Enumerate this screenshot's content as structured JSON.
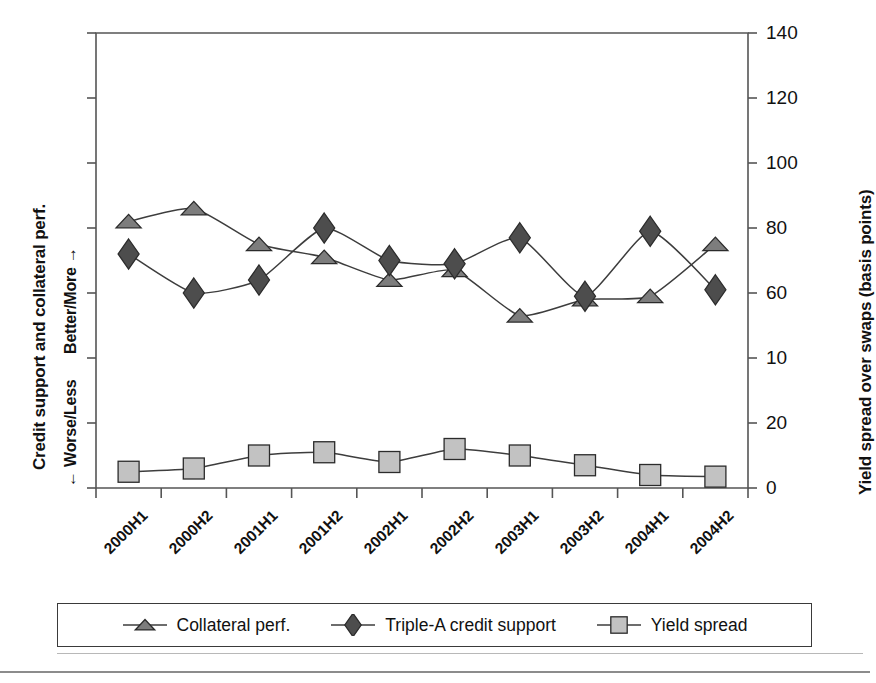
{
  "chart_data": {
    "type": "line",
    "title": "",
    "subtitle": "",
    "categories": [
      "2000H1",
      "2000H2",
      "2001H1",
      "2001H2",
      "2002H1",
      "2002H2",
      "2003H1",
      "2003H2",
      "2004H1",
      "2004H2"
    ],
    "series": [
      {
        "name": "Collateral perf.",
        "marker": "triangle",
        "color": "#7d7d7d",
        "values": [
          82,
          86,
          75,
          71,
          64,
          67,
          53,
          58,
          59,
          75
        ]
      },
      {
        "name": "Triple-A credit support",
        "marker": "diamond",
        "color": "#4d4d4d",
        "values": [
          72,
          60,
          64,
          80,
          70,
          69,
          77,
          59,
          79,
          61
        ]
      },
      {
        "name": "Yield spread",
        "marker": "square",
        "color": "#c2c2c2",
        "values": [
          5,
          6,
          10,
          11,
          8,
          12,
          10,
          7,
          4,
          3.5
        ]
      }
    ],
    "xlabel": "",
    "ylabel_left": "Credit support and collateral perf.",
    "ylabel_left_scale": "← Worse/Less      Better/More →",
    "ylabel_right": "Yield spread over swaps (basis points)",
    "ylim": [
      0,
      140
    ],
    "yticks": [
      0,
      20,
      10,
      60,
      80,
      100,
      120,
      140
    ],
    "ytick_labels": [
      "0",
      "20",
      "10",
      "60",
      "80",
      "100",
      "120",
      "140"
    ],
    "grid": false,
    "legend_position": "bottom"
  },
  "axis": {
    "left_title": "Credit support and collateral perf.",
    "left_scale_worse": "← Worse/Less",
    "left_scale_better": "Better/More →",
    "right_title": "Yield spread over swaps (basis points)"
  },
  "legend": {
    "items": [
      {
        "label": "Collateral perf.",
        "marker": "triangle-marker",
        "color": "#7d7d7d"
      },
      {
        "label": "Triple-A credit support",
        "marker": "diamond-marker",
        "color": "#4d4d4d"
      },
      {
        "label": "Yield spread",
        "marker": "square-marker",
        "color": "#c2c2c2"
      }
    ]
  }
}
